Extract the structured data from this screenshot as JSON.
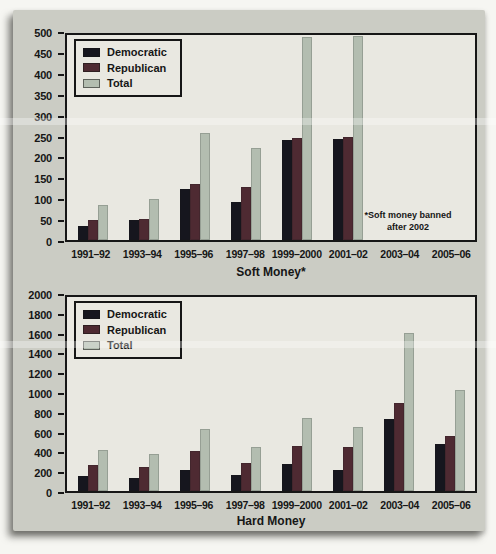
{
  "chart_data": [
    {
      "type": "bar",
      "title": "Soft Money*",
      "categories": [
        "1991–92",
        "1993–94",
        "1995–96",
        "1997–98",
        "1999–2000",
        "2001–02",
        "2003–04",
        "2005–06"
      ],
      "series": [
        {
          "name": "Democratic",
          "color": "#16161e",
          "values": [
            35,
            48,
            124,
            93,
            245,
            246,
            0,
            0
          ]
        },
        {
          "name": "Republican",
          "color": "#4e2a32",
          "values": [
            48,
            52,
            136,
            130,
            250,
            252,
            0,
            0
          ]
        },
        {
          "name": "Total",
          "color": "#b3bdb0",
          "values": [
            85,
            100,
            262,
            225,
            495,
            498,
            0,
            0
          ]
        }
      ],
      "ylim": [
        0,
        500
      ],
      "ytick_step": 50,
      "grid": false,
      "legend_position": "top-left",
      "annotation": [
        "*Soft money banned",
        "after 2002"
      ]
    },
    {
      "type": "bar",
      "title": "Hard Money",
      "categories": [
        "1991–92",
        "1993–94",
        "1995–96",
        "1997–98",
        "1999–2000",
        "2001–02",
        "2003–04",
        "2005–06"
      ],
      "series": [
        {
          "name": "Democratic",
          "color": "#16161e",
          "values": [
            155,
            135,
            220,
            160,
            275,
            220,
            740,
            480
          ]
        },
        {
          "name": "Republican",
          "color": "#4e2a32",
          "values": [
            265,
            245,
            415,
            290,
            465,
            450,
            905,
            570
          ]
        },
        {
          "name": "Total",
          "color": "#b3bdb0",
          "values": [
            420,
            380,
            640,
            450,
            755,
            660,
            1630,
            1045
          ]
        }
      ],
      "ylim": [
        0,
        2000
      ],
      "ytick_step": 200,
      "grid": false,
      "legend_position": "top-left",
      "annotation": []
    }
  ],
  "colors": {
    "card_background": "#cbccc4",
    "plot_background": "#e9e8e1",
    "axis_and_text": "#161616",
    "democratic": "#16161e",
    "republican": "#4e2a32",
    "total": "#b3bdb0"
  }
}
